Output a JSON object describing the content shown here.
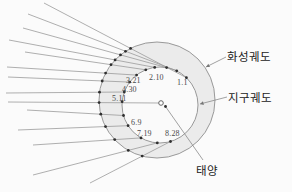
{
  "labels": {
    "mars_orbit": "화성궤도",
    "earth_orbit": "지구궤도",
    "sun": "태양"
  },
  "diagram": {
    "canvas": {
      "w": 292,
      "h": 192
    },
    "colors": {
      "background": "#fbfbfb",
      "annulus_fill": "#ebebeb",
      "inner_fill": "#fafafa",
      "orbit_stroke": "#8f8f8f",
      "sight_line": "#9a9a9a",
      "dot": "#2f2f2f",
      "text": "#4a4a4a"
    },
    "mars_orbit": {
      "cx": 157,
      "cy": 100,
      "r": 58
    },
    "earth_orbit": {
      "cx": 160,
      "cy": 105,
      "r": 38
    },
    "sun": {
      "x": 161,
      "y": 103,
      "r": 2.3
    },
    "observations": [
      {
        "date": "1.1",
        "earth_angle": 46,
        "left": [
          44,
          3
        ],
        "label_pos": [
          177,
          85
        ]
      },
      {
        "date": "",
        "earth_angle": 64,
        "left": [
          28,
          14
        ]
      },
      {
        "date": "2.10",
        "earth_angle": 80,
        "left": [
          23,
          28
        ],
        "label_pos": [
          149,
          80
        ]
      },
      {
        "date": "",
        "earth_angle": 98,
        "left": [
          9,
          40
        ]
      },
      {
        "date": "3.21",
        "earth_angle": 112,
        "left": [
          25,
          52
        ],
        "label_pos": [
          126,
          83
        ]
      },
      {
        "date": "",
        "earth_angle": 128,
        "left": [
          7,
          67
        ]
      },
      {
        "date": "4.30",
        "earth_angle": 143,
        "left": [
          8,
          77
        ],
        "label_pos": [
          122,
          92
        ]
      },
      {
        "date": "",
        "earth_angle": 160,
        "left": [
          6,
          93
        ]
      },
      {
        "date": "5.11",
        "earth_angle": 175,
        "left": [
          8,
          102
        ],
        "label_pos": [
          112,
          101
        ],
        "to_sun": true
      },
      {
        "date": "",
        "earth_angle": 196,
        "left": [
          27,
          110
        ]
      },
      {
        "date": "6.9",
        "earth_angle": 213,
        "left": [
          18,
          130
        ],
        "label_pos": [
          131,
          125
        ]
      },
      {
        "date": "7.19",
        "earth_angle": 240,
        "left": [
          33,
          145
        ],
        "label_pos": [
          137,
          136
        ]
      },
      {
        "date": "8.28",
        "earth_angle": 266,
        "left": [
          33,
          175
        ],
        "label_pos": [
          165,
          136
        ]
      },
      {
        "date": "",
        "earth_angle": 286,
        "left": [
          90,
          183
        ]
      }
    ],
    "callouts": {
      "mars": {
        "text_pos": [
          227,
          61
        ],
        "from": [
          226,
          57
        ],
        "to": [
          206,
          67
        ]
      },
      "earth": {
        "text_pos": [
          228,
          102
        ],
        "from": [
          227,
          97
        ],
        "to": [
          200,
          104
        ]
      },
      "sun": {
        "text_pos": [
          196,
          175
        ],
        "from": [
          203,
          160
        ],
        "to": [
          165.5,
          106.5
        ]
      }
    }
  }
}
